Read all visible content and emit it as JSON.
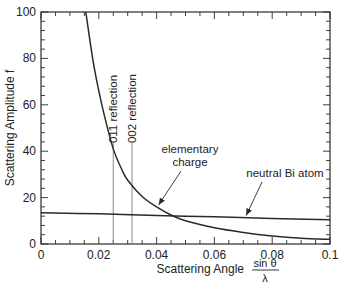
{
  "chart_data": {
    "type": "line",
    "title": "",
    "xlabel": "Scattering Angle",
    "xlabel_fraction": {
      "numerator": "sin θ",
      "denominator": "λ"
    },
    "ylabel": "Scattering Amplitude  f",
    "xlim": [
      0,
      0.1
    ],
    "ylim": [
      0,
      100
    ],
    "grid": false,
    "legend": null,
    "x_ticks": [
      0,
      0.02,
      0.04,
      0.06,
      0.08,
      0.1
    ],
    "x_tick_labels": [
      "0",
      "0.02",
      "0.04",
      "0.06",
      "0.08",
      "0.1"
    ],
    "y_ticks": [
      0,
      20,
      40,
      60,
      80,
      100
    ],
    "y_tick_labels": [
      "0",
      "20",
      "40",
      "60",
      "80",
      "100"
    ],
    "series": [
      {
        "name": "elementary charge",
        "x": [
          0.0155,
          0.018,
          0.02,
          0.022,
          0.025,
          0.028,
          0.03,
          0.035,
          0.04,
          0.045,
          0.05,
          0.06,
          0.07,
          0.08,
          0.09,
          0.1
        ],
        "y": [
          100,
          79,
          66,
          55,
          41,
          32,
          27.5,
          20.5,
          16,
          12.5,
          10,
          7,
          5,
          3.5,
          2.5,
          2
        ]
      },
      {
        "name": "neutral Bi atom",
        "x": [
          0,
          0.02,
          0.04,
          0.06,
          0.08,
          0.1
        ],
        "y": [
          13.5,
          13,
          12.3,
          11.7,
          11,
          10.5
        ]
      }
    ],
    "vertical_markers": [
      {
        "label": "011 reflection",
        "x": 0.025
      },
      {
        "label": "002 reflection",
        "x": 0.0315
      }
    ],
    "annotations": [
      {
        "text": "elementary charge",
        "points_to": {
          "x": 0.04,
          "y": 16
        }
      },
      {
        "text": "neutral Bi atom",
        "points_to": {
          "x": 0.071,
          "y": 11.4
        }
      }
    ]
  },
  "labels": {
    "y_axis": "Scattering Amplitude  f",
    "x_axis": "Scattering Angle",
    "x_frac_num": "sin θ",
    "x_frac_den": "λ",
    "annot_elem_line1": "elementary",
    "annot_elem_line2": "charge",
    "annot_bi": "neutral Bi atom",
    "refl_011": "011 reflection",
    "refl_002": "002 reflection"
  }
}
